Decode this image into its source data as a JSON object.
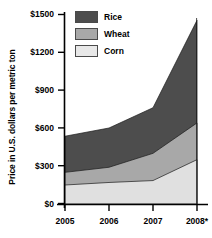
{
  "chart_data": {
    "type": "area",
    "title": "",
    "subtitle": "",
    "xlabel": "",
    "ylabel": "Price in U.S. dollars per metric ton",
    "stacked": true,
    "grid": false,
    "legend_position": "top-left-inside",
    "categories": [
      "2005",
      "2006",
      "2007",
      "2008*"
    ],
    "x_tick_labels": [
      "2005",
      "2006",
      "2007",
      "2008*"
    ],
    "y_tick_labels": [
      "$0",
      "$300",
      "$600",
      "$900",
      "$1200",
      "$1500"
    ],
    "y_tick_values": [
      0,
      300,
      600,
      900,
      1200,
      1500
    ],
    "ylim": [
      0,
      1500
    ],
    "series": [
      {
        "name": "Corn",
        "color": "#e0e0e0",
        "values": [
          150,
          170,
          185,
          350
        ]
      },
      {
        "name": "Wheat",
        "color": "#a8a8a8",
        "values": [
          100,
          120,
          215,
          290
        ]
      },
      {
        "name": "Rice",
        "color": "#4d4d4d",
        "values": [
          285,
          310,
          360,
          810
        ]
      }
    ],
    "cumulative_tops": {
      "Corn": [
        150,
        170,
        185,
        350
      ],
      "Wheat": [
        250,
        290,
        400,
        640
      ],
      "Rice": [
        535,
        600,
        760,
        1450
      ]
    },
    "legend": [
      {
        "label": "Rice",
        "color": "#4d4d4d"
      },
      {
        "label": "Wheat",
        "color": "#a8a8a8"
      },
      {
        "label": "Corn",
        "color": "#e8e8e8"
      }
    ],
    "axis_color": "#000000"
  }
}
